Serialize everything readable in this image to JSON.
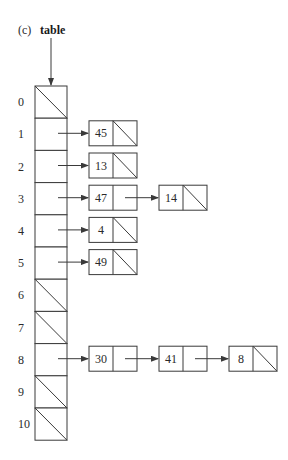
{
  "figure": {
    "panel_label": "(c)",
    "pointer_name": "table"
  },
  "table": {
    "size": 11,
    "indices": [
      "0",
      "1",
      "2",
      "3",
      "4",
      "5",
      "6",
      "7",
      "8",
      "9",
      "10"
    ],
    "buckets": [
      {
        "index": 0,
        "chain": []
      },
      {
        "index": 1,
        "chain": [
          "45"
        ]
      },
      {
        "index": 2,
        "chain": [
          "13"
        ]
      },
      {
        "index": 3,
        "chain": [
          "47",
          "14"
        ]
      },
      {
        "index": 4,
        "chain": [
          "4"
        ]
      },
      {
        "index": 5,
        "chain": [
          "49"
        ]
      },
      {
        "index": 6,
        "chain": []
      },
      {
        "index": 7,
        "chain": []
      },
      {
        "index": 8,
        "chain": [
          "30",
          "41",
          "8"
        ]
      },
      {
        "index": 9,
        "chain": []
      },
      {
        "index": 10,
        "chain": []
      }
    ]
  },
  "colors": {
    "stroke": "#3a3a3a",
    "background": "#ffffff"
  }
}
